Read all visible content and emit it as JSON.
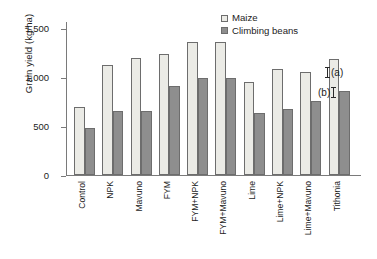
{
  "chart_data": {
    "type": "bar",
    "title": "",
    "xlabel": "",
    "ylabel": "Grain yield (kg/ha)",
    "ylim": [
      0,
      1700
    ],
    "yticks": [
      0,
      500,
      1000,
      1500
    ],
    "ytick_labels": [
      "0",
      "500",
      "1,000",
      "1,500"
    ],
    "grid": false,
    "legend_position": "top-right",
    "categories": [
      "Control",
      "NPK",
      "Mavuno",
      "FYM",
      "FYM+NPK",
      "FYM+Mavuno",
      "Lime",
      "Lime+NPK",
      "Lime+Mavuno",
      "Tithonia"
    ],
    "series": [
      {
        "name": "Maize",
        "color": "#ebebe6",
        "values": [
          750,
          1210,
          1290,
          1340,
          1470,
          1470,
          1030,
          1170,
          1135,
          1280
        ]
      },
      {
        "name": "Climbing beans",
        "color": "#8e8e8e",
        "values": [
          520,
          710,
          710,
          980,
          1070,
          1070,
          680,
          730,
          820,
          930
        ]
      }
    ],
    "annotations": [
      {
        "id": "err-a",
        "label": "(a)",
        "marker": "error-bar-i",
        "marker_side": "left"
      },
      {
        "id": "err-b",
        "label": "(b)",
        "marker": "error-bar-i",
        "marker_side": "right"
      }
    ]
  },
  "legend": {
    "items": [
      {
        "label": "Maize",
        "swatch": "maize"
      },
      {
        "label": "Climbing beans",
        "swatch": "beans"
      }
    ]
  },
  "colors": {
    "maize": "#ebebe6",
    "beans": "#8e8e8e",
    "axis": "#7a7a7a",
    "text": "#1c1c1c",
    "background": "#ffffff"
  }
}
